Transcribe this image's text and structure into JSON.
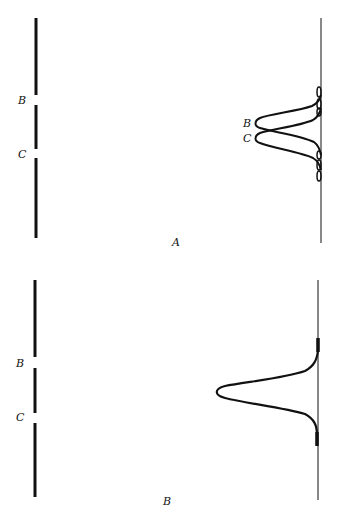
{
  "panels": [
    {
      "id": "A",
      "caption": "A",
      "column_labels": [
        "B",
        "C"
      ],
      "peak_labels": [
        "B",
        "C"
      ],
      "description": "Two partially resolved elution peaks B and C with side oscillations"
    },
    {
      "id": "B",
      "caption": "B",
      "column_labels": [
        "B",
        "C"
      ],
      "description": "Single merged broad peak"
    }
  ],
  "colors": {
    "ink": "#111111",
    "background": "#ffffff"
  }
}
